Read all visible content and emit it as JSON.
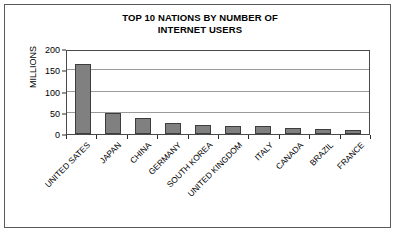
{
  "figure": {
    "title_line_1": "TOP 10 NATIONS BY NUMBER OF",
    "title_line_2": "INTERNET USERS",
    "y_axis_title": "MILLIONS",
    "frame_color": "#5a5a5a",
    "background_color": "#ffffff",
    "bar_fill_color": "#808080",
    "bar_outline_color": "#3d3d3d",
    "gridline_color": "#9a9a9a",
    "axis_color": "#4a4a4a"
  },
  "chart_data": {
    "type": "bar",
    "title": "TOP 10 NATIONS BY NUMBER OF INTERNET USERS",
    "xlabel": "",
    "ylabel": "MILLIONS",
    "ylim": [
      0,
      200
    ],
    "yticks": [
      0,
      50,
      100,
      150,
      200
    ],
    "ytick_labels": [
      "0",
      "50",
      "100",
      "150",
      "200"
    ],
    "grid": true,
    "grid_axis": "y",
    "legend": false,
    "orientation": "vertical",
    "categories": [
      "UNITED SATES",
      "JAPAN",
      "CHINA",
      "GERMANY",
      "SOUTH KOREA",
      "UNITED KINGDOM",
      "ITALY",
      "CANADA",
      "BRAZIL",
      "FRANCE"
    ],
    "values": [
      165,
      50,
      37,
      27,
      22,
      19,
      18,
      13,
      11,
      10
    ],
    "series": [
      {
        "name": "Internet users (millions)",
        "values": [
          165,
          50,
          37,
          27,
          22,
          19,
          18,
          13,
          11,
          10
        ]
      }
    ]
  }
}
